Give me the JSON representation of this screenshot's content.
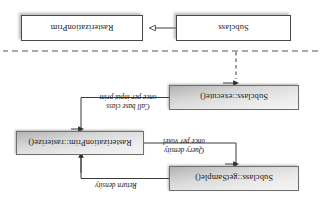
{
  "figure": {
    "type": "uml-interaction-diagram",
    "orientation": "rotated-180",
    "boxes": {
      "get_sample": "Subclass::getSample()",
      "rasterize": "RasterizationPrim::rasterize()",
      "execute": "Subclass::execute()",
      "subclass": "Subclass",
      "rasterization_prim": "RasterizationPrim"
    },
    "annotations": {
      "return_density": "Return density",
      "query_density_line1": "Query density",
      "query_density_line2": "once per voxel",
      "call_base_line1": "Call base class",
      "call_base_line2": "once per input prim"
    },
    "colors": {
      "box_border": "#6f6f6f",
      "plain_border": "#4a4a4a",
      "wire": "#3a3a3a",
      "separator": "#555555",
      "text": "#1a1a1a",
      "background": "#ffffff"
    }
  }
}
